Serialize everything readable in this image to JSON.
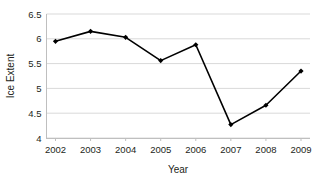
{
  "chart_data": {
    "type": "line",
    "title": "",
    "subtitle": "",
    "xlabel": "Year",
    "ylabel": "Ice Extent",
    "categories": [
      "2002",
      "2003",
      "2004",
      "2005",
      "2006",
      "2007",
      "2008",
      "2009"
    ],
    "x": [
      2002,
      2003,
      2004,
      2005,
      2006,
      2007,
      2008,
      2009
    ],
    "values": [
      5.95,
      6.15,
      6.03,
      5.56,
      5.88,
      4.27,
      4.66,
      5.35
    ],
    "series": [
      {
        "name": "Ice Extent",
        "values": [
          5.95,
          6.15,
          6.03,
          5.56,
          5.88,
          4.27,
          4.66,
          5.35
        ]
      }
    ],
    "xlim": [
      2002,
      2009
    ],
    "ylim": [
      4,
      6.5
    ],
    "y_ticks": [
      4,
      4.5,
      5,
      5.5,
      6,
      6.5
    ],
    "y_tick_labels": [
      "4",
      "4.5",
      "5",
      "5.5",
      "6",
      "6.5"
    ],
    "x_ticks": [
      2002,
      2003,
      2004,
      2005,
      2006,
      2007,
      2008,
      2009
    ],
    "x_tick_labels": [
      "2002",
      "2003",
      "2004",
      "2005",
      "2006",
      "2007",
      "2008",
      "2009"
    ],
    "grid": "horizontal",
    "legend": "none",
    "annotations": [],
    "colors": {
      "line": "#000000",
      "marker": "#000000",
      "grid": "#d9d9d9",
      "axis": "#bfbfbf",
      "text": "#231f20",
      "background": "#ffffff"
    },
    "marker": "diamond",
    "line_width": 1.6
  }
}
